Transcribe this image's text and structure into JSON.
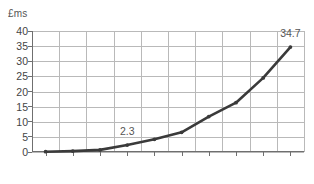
{
  "chart_data": {
    "type": "line",
    "title": "",
    "subtitle": "",
    "xlabel": "",
    "ylabel": "£ms",
    "categories": [
      "2005",
      "2006",
      "2007",
      "2008",
      "2009",
      "2010",
      "2011",
      "2012",
      "2013",
      "2014"
    ],
    "values": [
      0.1,
      0.3,
      0.7,
      2.3,
      4.2,
      6.5,
      11.7,
      16.3,
      24.5,
      34.7
    ],
    "series": [
      {
        "name": "",
        "values": [
          0.1,
          0.3,
          0.7,
          2.3,
          4.2,
          6.5,
          11.7,
          16.3,
          24.5,
          34.7
        ]
      }
    ],
    "ylim": [
      0,
      40
    ],
    "yticks": [
      0,
      5,
      10,
      15,
      20,
      25,
      30,
      35,
      40
    ],
    "ytick_labels": [
      "0",
      "5",
      "10",
      "15",
      "20",
      "25",
      "30",
      "35",
      "40"
    ],
    "xtick_labels": [
      "2005",
      "2006",
      "2007",
      "2008",
      "2009",
      "2010",
      "2011",
      "2012",
      "2013",
      "2014"
    ],
    "grid": true,
    "grid_horizontal": true,
    "grid_vertical": true,
    "legend": false,
    "legend_position": "none",
    "markers": true,
    "annotations": [
      {
        "category": "2008",
        "value": 2.3,
        "text": "2.3"
      },
      {
        "category": "2014",
        "value": 34.7,
        "text": "34.7"
      }
    ],
    "colors": {
      "line": "#3a3a3a",
      "marker": "#3a3a3a",
      "grid": "#b9b9b9",
      "axis": "#6f6f6f",
      "text": "#444444",
      "label_text": "#555555",
      "background": "#ffffff"
    }
  }
}
